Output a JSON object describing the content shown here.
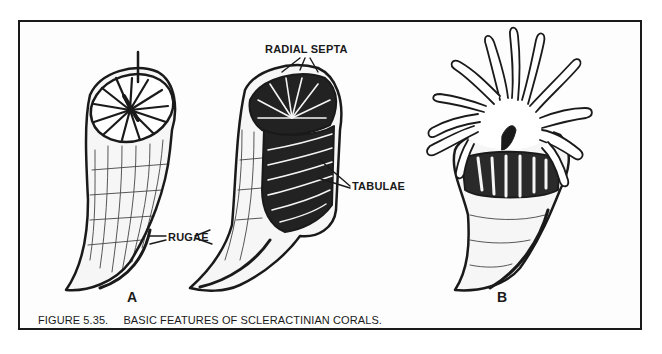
{
  "figure": {
    "number": "FIGURE 5.35.",
    "title": "BASIC FEATURES OF SCLERACTINIAN CORALS."
  },
  "labels": {
    "radial_septa": "RADIAL SEPTA",
    "tabulae": "TABULAE",
    "rugae": "RUGAE"
  },
  "panels": [
    {
      "id": "A",
      "letter": "A",
      "description": "Two skeletal coral cups (exterior and cutaway views)"
    },
    {
      "id": "B",
      "letter": "B",
      "description": "Living coral polyp with tentacles extended"
    }
  ],
  "colors": {
    "ink": "#1a1a1a",
    "paper": "#fdfdfd"
  }
}
